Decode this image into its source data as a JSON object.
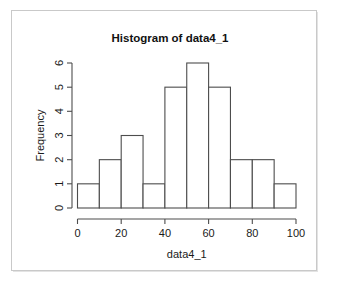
{
  "chart_data": {
    "type": "bar",
    "title": "Histogram of data4_1",
    "xlabel": "data4_1",
    "ylabel": "Frequency",
    "categories": [
      "0-10",
      "10-20",
      "20-30",
      "30-40",
      "40-50",
      "50-60",
      "60-70",
      "70-80",
      "80-90",
      "90-100"
    ],
    "bin_edges": [
      0,
      10,
      20,
      30,
      40,
      50,
      60,
      70,
      80,
      90,
      100
    ],
    "values": [
      1,
      2,
      3,
      1,
      5,
      6,
      5,
      2,
      2,
      1
    ],
    "bin_width": 10,
    "n_total": 28,
    "xlim": [
      0,
      100
    ],
    "ylim": [
      0,
      6
    ],
    "xticks": [
      0,
      20,
      40,
      60,
      80,
      100
    ],
    "xtick_labels": [
      "0",
      "20",
      "40",
      "60",
      "80",
      "100"
    ],
    "yticks": [
      0,
      1,
      2,
      3,
      4,
      5,
      6
    ],
    "ytick_labels": [
      "0",
      "1",
      "2",
      "3",
      "4",
      "5",
      "6"
    ],
    "grid": false,
    "legend": false,
    "bar_fill": "#ffffff",
    "bar_stroke": "#4d4d4d",
    "background": "#ffffff",
    "frame_color": "#c9c9c9",
    "ylabel_rotation": -90,
    "ytick_label_rotation": -90
  }
}
